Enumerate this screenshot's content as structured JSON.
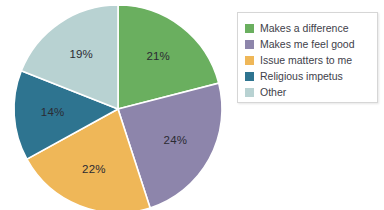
{
  "chart_data": {
    "type": "pie",
    "title": "",
    "subtitle": "",
    "xlabel": "",
    "ylabel": "",
    "grid": false,
    "legend_position": "right",
    "start_angle_deg": 0,
    "direction": "clockwise",
    "categories": [
      "Makes a difference",
      "Makes me feel good",
      "Issue matters to me",
      "Religious impetus",
      "Other"
    ],
    "values": [
      21,
      24,
      22,
      14,
      19
    ],
    "value_unit": "%",
    "data_labels": [
      "21%",
      "24%",
      "22%",
      "14%",
      "19%"
    ],
    "colors": [
      "#6aaf5f",
      "#8d85ab",
      "#efb758",
      "#2e7490",
      "#b8d2d2"
    ],
    "slices": [
      {
        "label": "Makes a difference",
        "value": 21,
        "data_label": "21%",
        "color": "#6aaf5f"
      },
      {
        "label": "Makes me feel good",
        "value": 24,
        "data_label": "24%",
        "color": "#8d85ab"
      },
      {
        "label": "Issue matters to me",
        "value": 22,
        "data_label": "22%",
        "color": "#efb758"
      },
      {
        "label": "Religious impetus",
        "value": 14,
        "data_label": "14%",
        "color": "#2e7490"
      },
      {
        "label": "Other",
        "value": 19,
        "data_label": "19%",
        "color": "#b8d2d2"
      }
    ]
  },
  "legend": {
    "items": [
      {
        "label": "Makes a difference",
        "color": "#6aaf5f"
      },
      {
        "label": "Makes me feel good",
        "color": "#8d85ab"
      },
      {
        "label": "Issue matters to me",
        "color": "#efb758"
      },
      {
        "label": "Religious impetus",
        "color": "#2e7490"
      },
      {
        "label": "Other",
        "color": "#b8d2d2"
      }
    ]
  },
  "style": {
    "background": "#ffffff",
    "slice_separator": "#ffffff",
    "legend_border": "#d6d6d6",
    "label_text": "#2b2b33"
  }
}
